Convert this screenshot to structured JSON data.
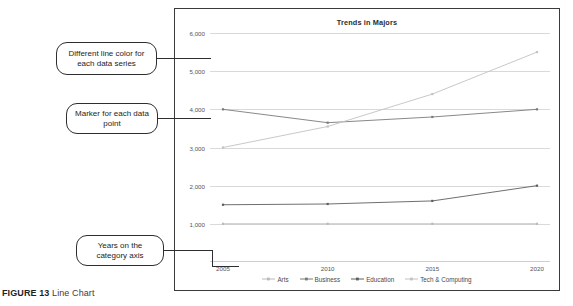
{
  "caption": {
    "figure_label": "FIGURE 13",
    "figure_title": "Line Chart"
  },
  "callouts": [
    {
      "id": "line-color",
      "text": "Different line color for each data series"
    },
    {
      "id": "marker",
      "text": "Marker for each data point"
    },
    {
      "id": "category-axis",
      "text": "Years on the category axis"
    }
  ],
  "chart_data": {
    "type": "line",
    "title": "Trends in Majors",
    "xlabel": "",
    "ylabel": "",
    "categories": [
      "2005",
      "2010",
      "2015",
      "2020"
    ],
    "ylim": [
      0,
      6000
    ],
    "yticks": [
      "1,000",
      "2,000",
      "3,000",
      "4,000",
      "5,000",
      "6,000"
    ],
    "ytick_values": [
      1000,
      2000,
      3000,
      4000,
      5000,
      6000
    ],
    "grid": true,
    "legend_position": "bottom",
    "series": [
      {
        "name": "Arts",
        "color": "#b9b9b9",
        "values": [
          1000,
          1000,
          1000,
          1000
        ]
      },
      {
        "name": "Business",
        "color": "#7a7a7a",
        "values": [
          4000,
          3650,
          3800,
          4000
        ]
      },
      {
        "name": "Education",
        "color": "#5e5e5e",
        "values": [
          1500,
          1520,
          1600,
          2000
        ]
      },
      {
        "name": "Tech & Computing",
        "color": "#c2c2c2",
        "values": [
          3000,
          3550,
          4400,
          5500
        ]
      }
    ]
  }
}
